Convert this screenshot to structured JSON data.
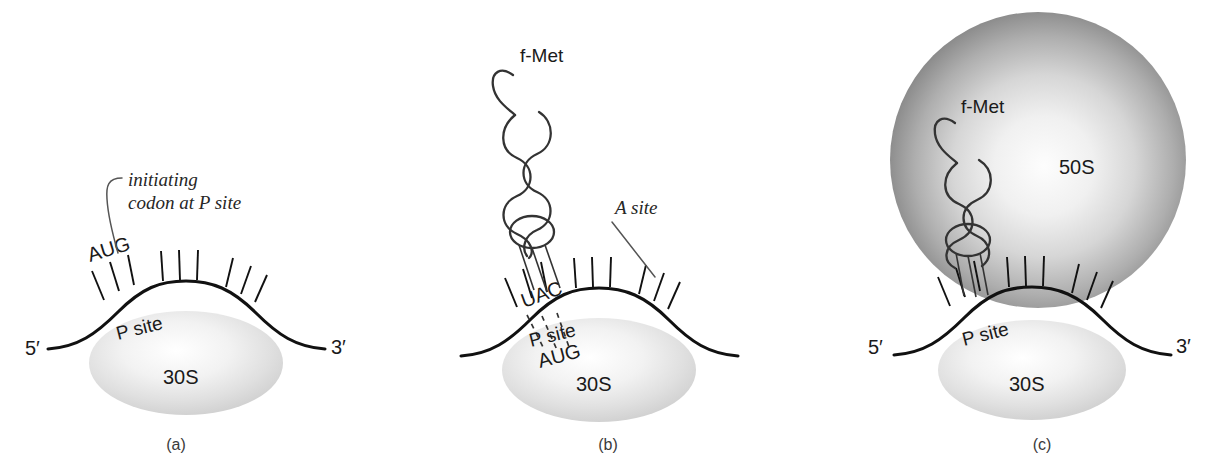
{
  "figure": {
    "background_color": "#ffffff",
    "ink_color": "#111111",
    "subunit_fill": "#e6e6e6"
  },
  "panels": [
    {
      "id": "a",
      "caption": "(a)",
      "stage": "mRNA bound to 30S subunit; initiating codon positioned at P site",
      "labels": {
        "five_prime": "5′",
        "three_prime": "3′",
        "codon": "AUG",
        "p_site": "P site",
        "small_subunit": "30S",
        "annotation_line1": "initiating",
        "annotation_line2": "codon at P site"
      },
      "codon_ticks": [
        3,
        3,
        3
      ]
    },
    {
      "id": "b",
      "caption": "(b)",
      "stage": "Initiator tRNA carrying f-Met base-pairs with the AUG codon; A site is vacant",
      "labels": {
        "amino_acid": "f-Met",
        "anticodon": "UAC",
        "codon": "AUG",
        "a_site": "A site",
        "p_site": "P site",
        "small_subunit": "30S"
      },
      "codon_ticks": [
        3,
        3,
        3
      ],
      "base_pairs": 3
    },
    {
      "id": "c",
      "caption": "(c)",
      "stage": "50S subunit joins to form the complete 70S initiation complex",
      "labels": {
        "five_prime": "5′",
        "three_prime": "3′",
        "amino_acid": "f-Met",
        "large_subunit": "50S",
        "p_site": "P site",
        "small_subunit": "30S"
      },
      "codon_ticks": [
        3,
        3,
        3
      ]
    }
  ]
}
